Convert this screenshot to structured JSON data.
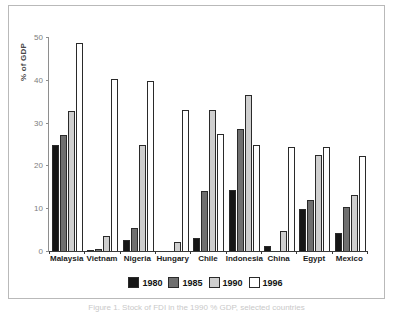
{
  "chart_data": {
    "type": "bar",
    "title": "",
    "xlabel": "",
    "ylabel": "% of GDP",
    "ylim": [
      0,
      50
    ],
    "yticks": [
      0,
      10,
      20,
      30,
      40,
      50
    ],
    "grid": false,
    "legend_position": "bottom",
    "categories": [
      "Malaysia",
      "Vietnam",
      "Nigeria",
      "Hungary",
      "Chile",
      "Indonesia",
      "China",
      "Egypt",
      "Mexico"
    ],
    "series": [
      {
        "name": "1980",
        "color": "#161616",
        "values": [
          24.8,
          0.3,
          2.5,
          0.0,
          3.1,
          14.3,
          1.2,
          9.7,
          4.2
        ]
      },
      {
        "name": "1985",
        "color": "#6f6f6f",
        "values": [
          27.0,
          0.4,
          5.3,
          0.0,
          14.0,
          28.5,
          0.2,
          11.9,
          10.2
        ]
      },
      {
        "name": "1990",
        "color": "#cfcfcf",
        "values": [
          32.8,
          3.5,
          24.7,
          2.0,
          33.0,
          36.4,
          4.6,
          22.5,
          13.0
        ]
      },
      {
        "name": "1996",
        "color": "#ffffff",
        "values": [
          48.5,
          40.1,
          39.8,
          33.0,
          27.3,
          24.7,
          24.4,
          24.2,
          22.1
        ]
      }
    ]
  },
  "legend": {
    "entries": [
      {
        "label": "1980",
        "color": "#161616"
      },
      {
        "label": "1985",
        "color": "#6f6f6f"
      },
      {
        "label": "1990",
        "color": "#cfcfcf"
      },
      {
        "label": "1996",
        "color": "#ffffff"
      }
    ]
  },
  "caption": {
    "text": "Figure 1. Stock of FDI in the 1990 % GDP, selected countries"
  }
}
